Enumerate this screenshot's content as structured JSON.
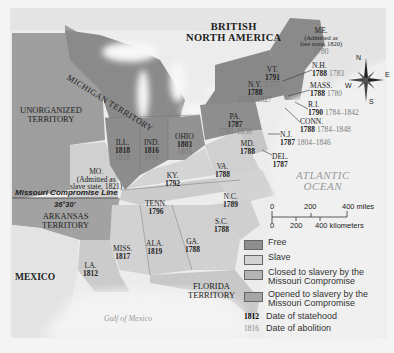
{
  "map": {
    "colors": {
      "free": "#8e8e8e",
      "slave": "#cfcfcf",
      "closed": "#b0b0b0",
      "opened": "#a6a6a6",
      "water": "#f4f4f4",
      "foreign": "#e2e2e2",
      "unorganized": "#9c9c9c"
    },
    "regions": {
      "british_north_america": "BRITISH\nNORTH AMERICA",
      "unorganized_territory": "UNORGANIZED\nTERRITORY",
      "michigan_territory": "MICHIGAN TERRITORY",
      "arkansas_territory": "ARKANSAS\nTERRITORY",
      "florida_territory": "FLORIDA\nTERRITORY",
      "mexico": "MEXICO",
      "atlantic_ocean": "ATLANTIC\nOCEAN",
      "gulf_of_mexico": "Gulf of Mexico"
    },
    "missouri_line": {
      "label": "Missouri Compromise Line",
      "latitude": "36°30'"
    },
    "states": {
      "me": {
        "name": "ME.",
        "note": "(Admitted as\nfree state, 1820)",
        "abolition": "1780"
      },
      "nh": {
        "name": "N.H.",
        "statehood": "1788",
        "abolition": "1783"
      },
      "vt": {
        "name": "VT.",
        "statehood": "1791",
        "abolition": "1777"
      },
      "ny": {
        "name": "N.Y.",
        "statehood": "1788",
        "abolition": "1799–1827"
      },
      "mass": {
        "name": "MASS.",
        "statehood": "1788",
        "abolition": "1780"
      },
      "ri": {
        "name": "R.I.",
        "statehood": "1790",
        "abolition": "1784–1842"
      },
      "conn": {
        "name": "CONN.",
        "statehood": "1788",
        "abolition": "1784–1848"
      },
      "nj": {
        "name": "N.J.",
        "statehood": "1787",
        "abolition": "1804–1846"
      },
      "pa": {
        "name": "PA.",
        "statehood": "1787",
        "abolition": "1780–1850"
      },
      "md": {
        "name": "MD.",
        "statehood": "1788"
      },
      "del": {
        "name": "DEL.",
        "statehood": "1787"
      },
      "va": {
        "name": "VA.",
        "statehood": "1788"
      },
      "nc": {
        "name": "N.C.",
        "statehood": "1789"
      },
      "sc": {
        "name": "S.C.",
        "statehood": "1788"
      },
      "ga": {
        "name": "GA.",
        "statehood": "1788"
      },
      "ohio": {
        "name": "OHIO",
        "statehood": "1803",
        "abolition": "1803"
      },
      "ind": {
        "name": "IND.",
        "statehood": "1816",
        "abolition": "1816"
      },
      "ill": {
        "name": "ILL.",
        "statehood": "1818",
        "abolition": "1818"
      },
      "ky": {
        "name": "KY.",
        "statehood": "1792"
      },
      "tenn": {
        "name": "TENN.",
        "statehood": "1796"
      },
      "ala": {
        "name": "ALA.",
        "statehood": "1819"
      },
      "miss": {
        "name": "MISS.",
        "statehood": "1817"
      },
      "la": {
        "name": "LA.",
        "statehood": "1812"
      },
      "mo": {
        "name": "MO.",
        "note": "(Admitted as\nslave state, 1821)"
      }
    },
    "compass": {
      "n": "N",
      "s": "S",
      "e": "E",
      "w": "W"
    },
    "scale": {
      "miles": [
        "0",
        "200",
        "400 miles"
      ],
      "km": [
        "0",
        "200",
        "400 kilometers"
      ]
    }
  },
  "legend": {
    "items": [
      {
        "key": "free",
        "label": "Free"
      },
      {
        "key": "slave",
        "label": "Slave"
      },
      {
        "key": "closed",
        "label": "Closed to slavery by the Missouri Compromise"
      },
      {
        "key": "opened",
        "label": "Opened to slavery by the Missouri Compromise"
      }
    ],
    "statehood_sample": "1812",
    "statehood_label": "Date of statehood",
    "abolition_sample": "1816",
    "abolition_label": "Date of abolition"
  }
}
